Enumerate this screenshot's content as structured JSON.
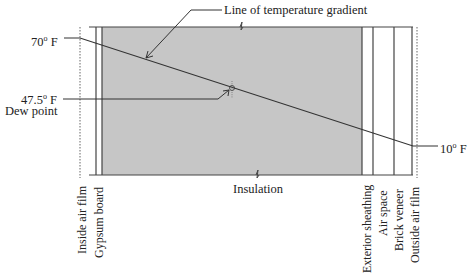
{
  "diagram": {
    "title_callout": "Line of temperature gradient",
    "inside_temp": {
      "value": "70",
      "unit": "F",
      "degree": "o"
    },
    "dew_point_temp": {
      "value": "47.5",
      "unit": "F",
      "degree": "o"
    },
    "dew_point_label": "Dew point",
    "outside_temp": {
      "value": "10",
      "unit": "F",
      "degree": "o"
    },
    "center_label": "Insulation",
    "layers": [
      {
        "label": "Inside air film"
      },
      {
        "label": "Gypsum board"
      },
      {
        "label": "Exterior sheathing"
      },
      {
        "label": "Air space"
      },
      {
        "label": "Brick veneer"
      },
      {
        "label": "Outside air film"
      }
    ],
    "colors": {
      "insulation_fill": "#c4c4c4",
      "line": "#333333"
    }
  }
}
